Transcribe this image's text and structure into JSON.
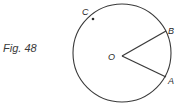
{
  "caption": "Fig. 48",
  "diagram": {
    "center_label": "O",
    "points": [
      {
        "name": "A",
        "label": "A"
      },
      {
        "name": "B",
        "label": "B"
      },
      {
        "name": "C",
        "label": "C"
      }
    ],
    "colors": {
      "stroke": "#3a3a3a",
      "text": "#2a2a2a"
    }
  }
}
